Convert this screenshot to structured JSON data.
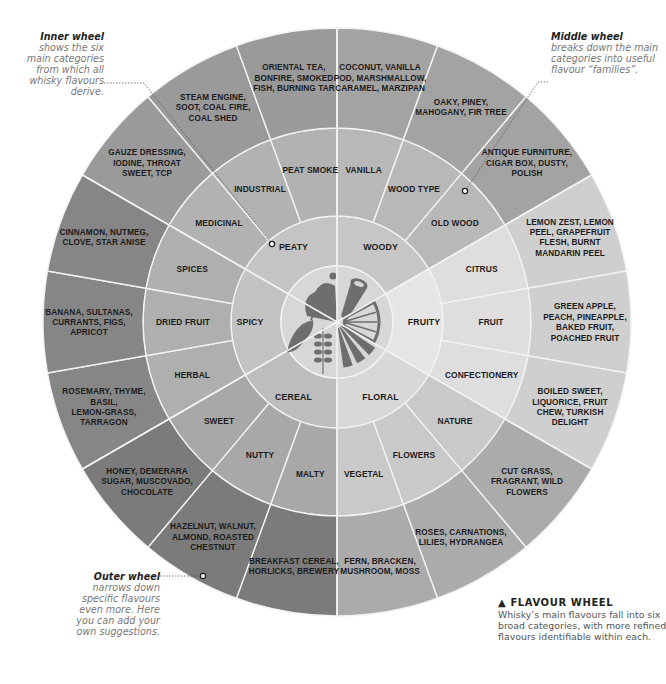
{
  "geometry": {
    "cx": 337,
    "cy": 322,
    "r_outer": 294,
    "r_ring2": 194,
    "r_ring1": 106,
    "r_icon": 56
  },
  "colors": {
    "separator": "#f2f2f2",
    "icon_disc": "#d7d7d7",
    "icon_fill": "#6e6e6e",
    "text": "#1c1c1c"
  },
  "categories": [
    {
      "name": "PEATY",
      "start": -150,
      "inner_color": "#c4c4c4",
      "mid_color": "#b2b2b2",
      "outer_color": "#9a9a9a",
      "subs": [
        {
          "mid": "MEDICINAL",
          "outer": [
            "GAUZE DRESSING,",
            "IODINE, THROAT",
            "SWEET, TCP"
          ]
        },
        {
          "mid": "INDUSTRIAL",
          "outer": [
            "STEAM ENGINE,",
            "SOOT, COAL FIRE,",
            "COAL SHED"
          ]
        },
        {
          "mid": "PEAT SMOKE",
          "outer": [
            "ORIENTAL TEA,",
            "BONFIRE, SMOKED",
            "FISH, BURNING TAR"
          ]
        }
      ]
    },
    {
      "name": "WOODY",
      "start": -90,
      "inner_color": "#c6c6c6",
      "mid_color": "#b8b8b8",
      "outer_color": "#a3a3a3",
      "subs": [
        {
          "mid": "VANILLA",
          "outer": [
            "COCONUT, VANILLA",
            "POD, MARSHMALLOW,",
            "CARAMEL, MARZIPAN"
          ]
        },
        {
          "mid": "WOOD TYPE",
          "outer": [
            "OAKY, PINEY,",
            "MAHOGANY, FIR TREE"
          ]
        },
        {
          "mid": "OLD WOOD",
          "outer": [
            "ANTIQUE FURNITURE,",
            "CIGAR BOX, DUSTY,",
            "POLISH"
          ]
        }
      ]
    },
    {
      "name": "FRUITY",
      "start": -30,
      "inner_color": "#e6e6e6",
      "mid_color": "#dedede",
      "outer_color": "#cfcfcf",
      "subs": [
        {
          "mid": "CITRUS",
          "outer": [
            "LEMON ZEST, LEMON",
            "PEEL, GRAPEFRUIT",
            "FLESH, BURNT",
            "MANDARIN PEEL"
          ]
        },
        {
          "mid": "FRUIT",
          "outer": [
            "GREEN APPLE,",
            "PEACH, PINEAPPLE,",
            "BAKED FRUIT,",
            "POACHED FRUIT"
          ]
        },
        {
          "mid": "CONFECTIONERY",
          "outer": [
            "BOILED SWEET,",
            "LIQUORICE, FRUIT",
            "CHEW, TURKISH",
            "DELIGHT"
          ]
        }
      ]
    },
    {
      "name": "FLORAL",
      "start": 30,
      "inner_color": "#d8d8d8",
      "mid_color": "#c9c9c9",
      "outer_color": "#ababab",
      "subs": [
        {
          "mid": "NATURE",
          "outer": [
            "CUT GRASS,",
            "FRAGRANT, WILD",
            "FLOWERS"
          ]
        },
        {
          "mid": "FLOWERS",
          "outer": [
            "ROSES, CARNATIONS,",
            "LILIES, HYDRANGEA"
          ]
        },
        {
          "mid": "VEGETAL",
          "outer": [
            "FERN, BRACKEN,",
            "MUSHROOM, MOSS"
          ]
        }
      ]
    },
    {
      "name": "CEREAL",
      "start": 90,
      "inner_color": "#bdbdbd",
      "mid_color": "#a8a8a8",
      "outer_color": "#7b7b7b",
      "subs": [
        {
          "mid": "MALTY",
          "outer": [
            "BREAKFAST CEREAL,",
            "HORLICKS, BREWERY"
          ]
        },
        {
          "mid": "NUTTY",
          "outer": [
            "HAZELNUT, WALNUT,",
            "ALMOND, ROASTED",
            "CHESTNUT"
          ]
        },
        {
          "mid": "SWEET",
          "outer": [
            "HONEY, DEMERARA",
            "SUGAR, MUSCOVADO,",
            "CHOCOLATE"
          ]
        }
      ]
    },
    {
      "name": "SPICY",
      "start": 150,
      "inner_color": "#c2c2c2",
      "mid_color": "#afafaf",
      "outer_color": "#868686",
      "subs": [
        {
          "mid": "HERBAL",
          "outer": [
            "ROSEMARY, THYME,",
            "BASIL,",
            "LEMON-GRASS,",
            "TARRAGON"
          ]
        },
        {
          "mid": "DRIED FRUIT",
          "outer": [
            "BANANA, SULTANAS,",
            "CURRANTS, FIGS,",
            "APRICOT"
          ]
        },
        {
          "mid": "SPICES",
          "outer": [
            "CINNAMON, NUTMEG,",
            "CLOVE, STAR ANISE"
          ]
        }
      ]
    }
  ],
  "icons": [
    "peat-smoke-icon",
    "wood-log-icon",
    "citrus-slice-icon",
    "flower-petals-icon",
    "wheat-icon",
    "chili-pepper-icon"
  ],
  "annotations": {
    "inner": {
      "title": "Inner wheel",
      "body": "shows the six main categories from which all whisky flavours derive."
    },
    "middle": {
      "title": "Middle wheel",
      "body": "breaks down the main categories into useful flavour “families”."
    },
    "outer": {
      "title": "Outer wheel",
      "body": "narrows down specific flavours even more. Here you can add your own suggestions."
    }
  },
  "caption": {
    "marker": "▲",
    "title": "FLAVOUR WHEEL",
    "body": "Whisky’s main flavours fall into six broad categories, with more refined flavours identifiable within each."
  }
}
